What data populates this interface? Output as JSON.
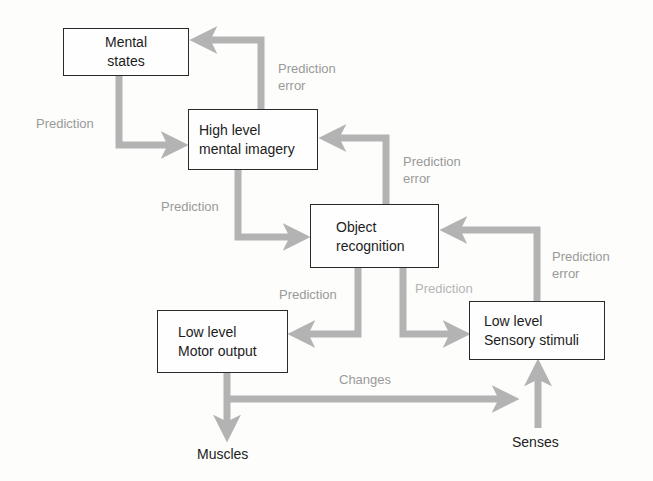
{
  "diagram": {
    "type": "flowchart",
    "nodes": [
      {
        "id": "mental_states",
        "lines": [
          "Mental",
          "states"
        ]
      },
      {
        "id": "high_level",
        "lines": [
          "High level",
          "mental imagery"
        ]
      },
      {
        "id": "object_recognition",
        "lines": [
          "Object",
          "recognition"
        ]
      },
      {
        "id": "motor_output",
        "lines": [
          "Low level",
          "Motor output"
        ]
      },
      {
        "id": "sensory_stimuli",
        "lines": [
          "Low level",
          "Sensory stimuli"
        ]
      }
    ],
    "terminals": {
      "muscles": "Muscles",
      "senses": "Senses"
    },
    "edge_labels": {
      "pred_ms_hl": "Prediction",
      "err_hl_ms": [
        "Prediction",
        "error"
      ],
      "pred_hl_or": "Prediction",
      "err_or_hl": [
        "Prediction",
        "error"
      ],
      "pred_or_mo": "Prediction",
      "pred_or_ss": "Prediction",
      "err_ss_or": [
        "Prediction",
        "error"
      ],
      "changes": "Changes"
    },
    "edges": [
      {
        "from": "mental_states",
        "to": "high_level",
        "label": "Prediction"
      },
      {
        "from": "high_level",
        "to": "mental_states",
        "label": "Prediction error"
      },
      {
        "from": "high_level",
        "to": "object_recognition",
        "label": "Prediction"
      },
      {
        "from": "object_recognition",
        "to": "high_level",
        "label": "Prediction error"
      },
      {
        "from": "object_recognition",
        "to": "motor_output",
        "label": "Prediction"
      },
      {
        "from": "object_recognition",
        "to": "sensory_stimuli",
        "label": "Prediction"
      },
      {
        "from": "sensory_stimuli",
        "to": "object_recognition",
        "label": "Prediction error"
      },
      {
        "from": "motor_output",
        "to": "muscles",
        "label": ""
      },
      {
        "from": "motor_output",
        "to": "sensory_stimuli",
        "label": "Changes"
      },
      {
        "from": "senses",
        "to": "sensory_stimuli",
        "label": ""
      }
    ],
    "colors": {
      "arrow": "#b3b3b3",
      "label": "#9a9a9a",
      "box_border": "#2a2a2a",
      "text": "#1c1c1c"
    }
  }
}
